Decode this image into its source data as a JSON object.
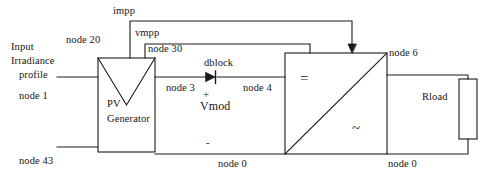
{
  "diagram": {
    "stroke_color": "#1a1a1a",
    "background_color": "#ffffff",
    "blocks": {
      "pv_generator": {
        "label_line1": "PV",
        "label_line2": "Generator",
        "symbol": "triangle-down"
      },
      "inverter": {
        "dc_symbol": "=",
        "ac_symbol": "~"
      },
      "load": {
        "label": "Rload"
      },
      "diode": {
        "label": "dblock"
      }
    },
    "labels": {
      "input_line1": "Input",
      "input_line2": "Irradiance",
      "input_line3": "profile",
      "node_1": "node 1",
      "node_43": "node 43",
      "impp": "impp",
      "node_20": "node 20",
      "vmpp": "vmpp",
      "node_30": "node 30",
      "node_3": "node 3",
      "node_4": "node 4",
      "node_6": "node 6",
      "node_0_left": "node 0",
      "node_0_right": "node 0",
      "vmod": "Vmod",
      "plus_sign": "+",
      "minus_sign": "-"
    }
  }
}
